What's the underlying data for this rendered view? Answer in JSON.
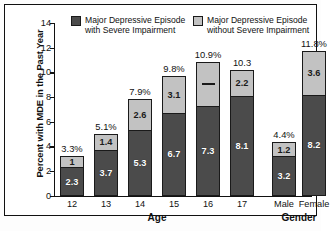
{
  "chart_data": {
    "type": "bar",
    "subtype": "stacked-bar",
    "title": "",
    "subtitle": "",
    "xlabel": "",
    "ylabel": "Percent with MDE in the Past Year",
    "ylim": [
      0,
      14
    ],
    "yticks": [
      0,
      2,
      4,
      6,
      8,
      10,
      12,
      14
    ],
    "ytick_labels": [
      "0",
      "2",
      "4",
      "6",
      "8",
      "10",
      "12",
      "14"
    ],
    "grid": false,
    "legend_position": "inside-top",
    "legend": [
      {
        "name": "Major Depressive Episode with Severe Impairment",
        "line1": "Major Depressive Episode",
        "line2": "with Severe Impairment",
        "color": "#4b4b4b"
      },
      {
        "name": "Major Depressive Episode without Severe Impairment",
        "line1": "Major Depressive Episode",
        "line2": "without Severe Impairment",
        "color": "#c2c2c2"
      }
    ],
    "groups": [
      {
        "label": "Age",
        "categories": [
          "12",
          "13",
          "14",
          "15",
          "16",
          "17"
        ]
      },
      {
        "label": "Gender",
        "categories": [
          "Male",
          "Female"
        ]
      }
    ],
    "categories": [
      "12",
      "13",
      "14",
      "15",
      "16",
      "17",
      "Male",
      "Female"
    ],
    "series": [
      {
        "name": "Major Depressive Episode with Severe Impairment",
        "color": "#4b4b4b",
        "values": [
          2.3,
          3.7,
          5.3,
          6.7,
          7.3,
          8.1,
          3.2,
          8.2
        ],
        "labels": [
          "2.3",
          "3.7",
          "5.3",
          "6.7",
          "7.3",
          "8.1",
          "3.2",
          "8.2"
        ]
      },
      {
        "name": "Major Depressive Episode without Severe Impairment",
        "color": "#c2c2c2",
        "values": [
          1.0,
          1.4,
          2.6,
          3.1,
          3.6,
          2.2,
          1.2,
          3.6
        ],
        "labels": [
          "1",
          "1.4",
          "2.6",
          "3.1",
          "—",
          "2.2",
          "1.2",
          "3.6"
        ]
      }
    ],
    "totals": [
      3.3,
      5.1,
      7.9,
      9.8,
      10.9,
      10.3,
      4.4,
      11.8
    ],
    "total_labels": [
      "3.3%",
      "5.1%",
      "7.9%",
      "9.8%",
      "10.9%",
      "10.3",
      "4.4%",
      "11.8%"
    ],
    "colors": {
      "with_impairment": "#4b4b4b",
      "without_impairment": "#c2c2c2",
      "axis": "#111111",
      "background": "#ffffff"
    }
  }
}
